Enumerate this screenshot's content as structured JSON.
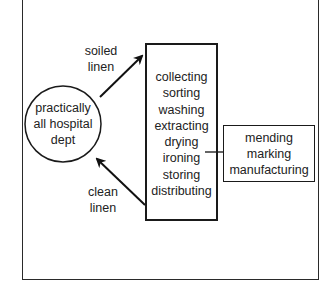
{
  "diagram": {
    "source_node": {
      "shape": "circle",
      "lines": [
        "practically",
        "all hospital",
        "dept"
      ]
    },
    "process_node": {
      "shape": "rectangle",
      "steps": [
        "collecting",
        "sorting",
        "washing",
        "extracting",
        "drying",
        "ironing",
        "storing",
        "distributing"
      ]
    },
    "auxiliary_node": {
      "shape": "rectangle",
      "steps": [
        "mending",
        "marking",
        "manufacturing"
      ]
    },
    "edges": [
      {
        "from": "source_node",
        "to": "process_node",
        "label_lines": [
          "soiled",
          "linen"
        ]
      },
      {
        "from": "process_node",
        "to": "source_node",
        "label_lines": [
          "clean",
          "linen"
        ]
      },
      {
        "from": "process_node",
        "to": "auxiliary_node",
        "label_lines": []
      }
    ]
  }
}
